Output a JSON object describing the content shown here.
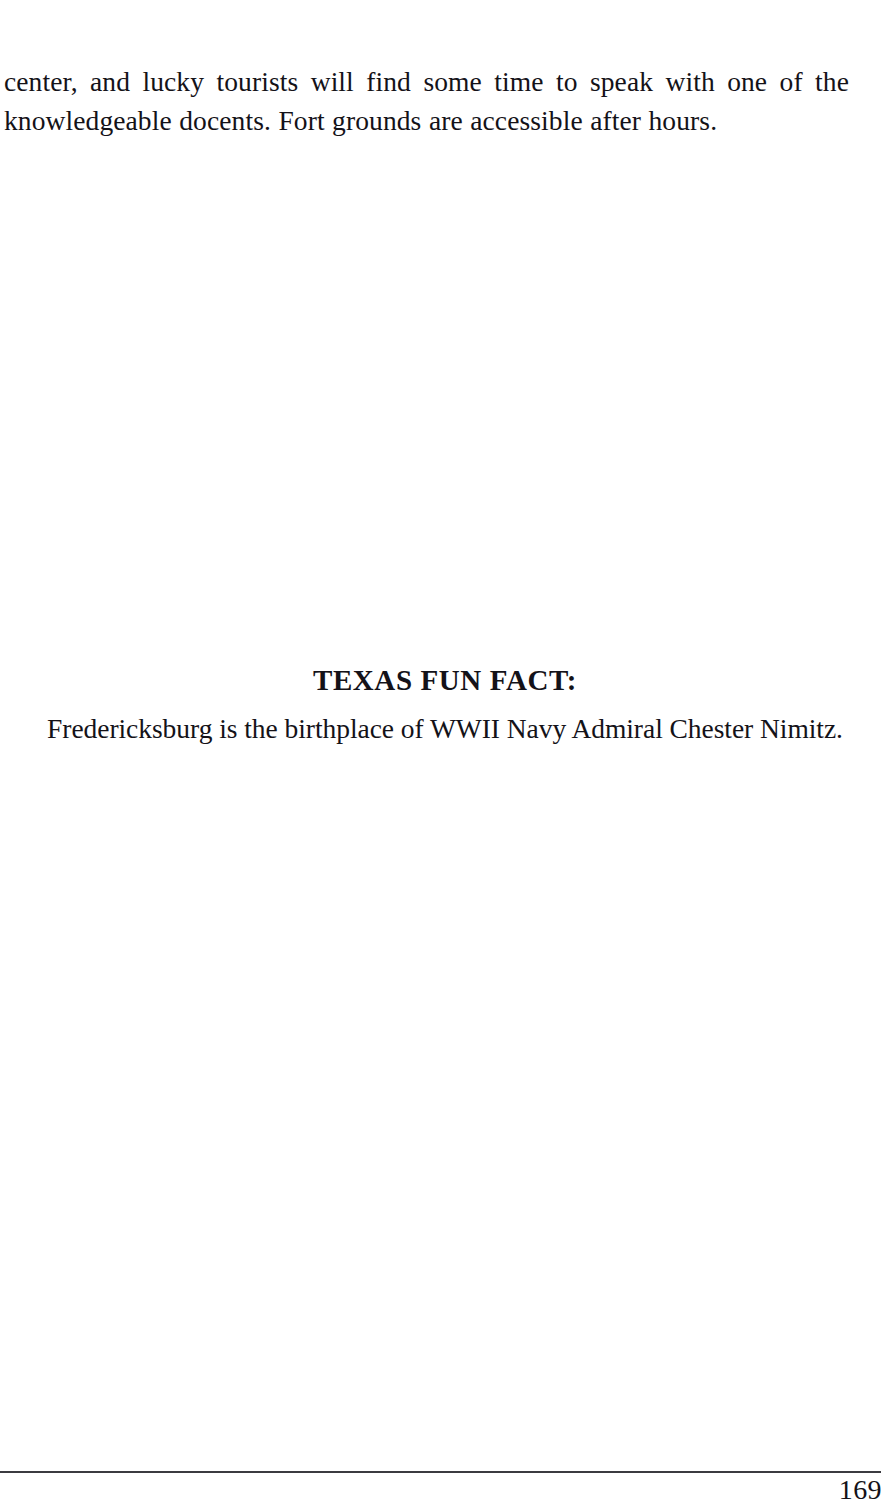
{
  "page": {
    "background_color": "#ffffff",
    "ink_color": "#141218",
    "body_paragraph": "center, and lucky tourists will find some time to speak with one of the knowledgeable docents. Fort grounds are accessible after hours."
  },
  "fun_fact": {
    "heading": "TEXAS FUN FACT:",
    "text": "Fredericksburg is the birthplace of WWII Navy Admiral Chester Nimitz."
  },
  "footer": {
    "page_number": "169",
    "rule_color": "#2a2a30"
  }
}
